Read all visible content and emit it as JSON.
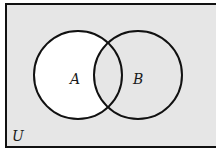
{
  "diagram": {
    "type": "venn",
    "universe_label": "U",
    "sets": [
      {
        "label": "A",
        "cx": 78,
        "cy": 75,
        "r": 44
      },
      {
        "label": "B",
        "cx": 138,
        "cy": 75,
        "r": 44
      }
    ],
    "shaded_region": "A minus B (A only)",
    "colors": {
      "background": "#e6e6e6",
      "highlight": "#ffffff",
      "stroke": "#111111"
    }
  }
}
